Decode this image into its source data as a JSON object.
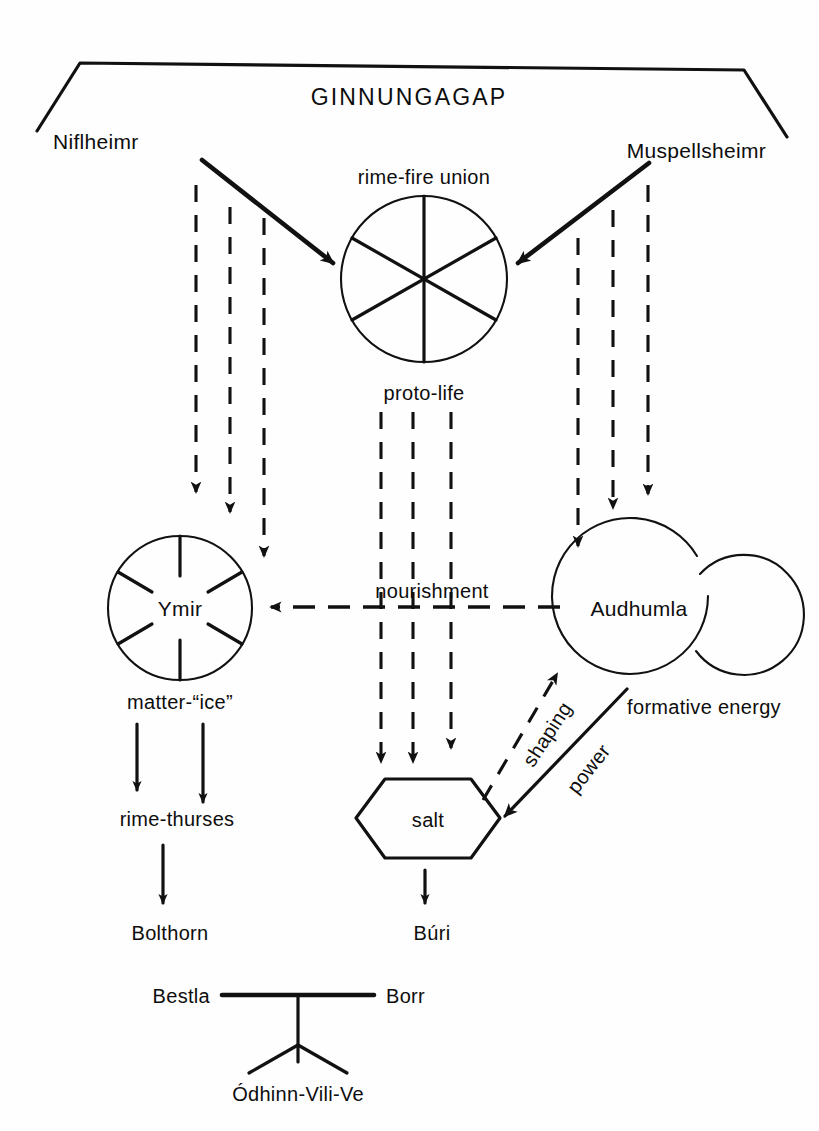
{
  "diagram": {
    "title": "GINNUNGAGAP",
    "type": "cosmological-flow-diagram",
    "nodes": {
      "ginnungagap": "GINNUNGAGAP",
      "niflheimr": "Niflheimr",
      "muspellsheimr": "Muspellsheimr",
      "rime_fire_union": "rime-fire union",
      "proto_life": "proto-life",
      "ymir": "Ymir",
      "matter_ice": "matter-“ice”",
      "audhumla": "Audhumla",
      "formative_energy": "formative energy",
      "nourishment": "nourishment",
      "salt": "salt",
      "rime_thurses": "rime-thurses",
      "bolthorn": "Bolthorn",
      "buri": "Búri",
      "bestla": "Bestla",
      "borr": "Borr",
      "odhinn_vili_ve": "Ódhinn-Vili-Ve"
    },
    "edge_labels": {
      "shaping": "shaping",
      "power": "power",
      "nourishment": "nourishment"
    },
    "colors": {
      "ink": "#111111",
      "background": "#fefefe"
    }
  }
}
